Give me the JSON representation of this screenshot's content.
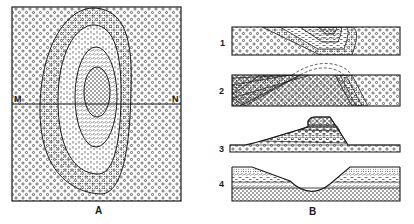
{
  "figure": {
    "panels": [
      {
        "id": "A",
        "label": "A",
        "type": "geologic-map",
        "line_endpoints": {
          "left": "M",
          "right": "N"
        },
        "units_outer_to_inner": [
          "coarse-circle",
          "fine-dot",
          "dash",
          "tick-hatch",
          "dot-core"
        ]
      },
      {
        "id": "B",
        "label": "B",
        "type": "cross-sections",
        "sections": [
          {
            "number": "1",
            "description": "folded strata, dipping beds"
          },
          {
            "number": "2",
            "description": "eroded anticline with projected dashed fold"
          },
          {
            "number": "3",
            "description": "mesa / butte of layered strata on base"
          },
          {
            "number": "4",
            "description": "valley cut through horizontal strata"
          }
        ]
      }
    ]
  },
  "colors": {
    "ink": "#1a1a1a",
    "paper": "#ffffff"
  }
}
